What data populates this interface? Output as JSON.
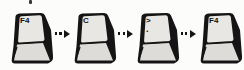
{
  "diagram": {
    "keys": [
      {
        "label": "F4"
      },
      {
        "label": "C"
      },
      {
        "label": ">",
        "sublabel": "."
      },
      {
        "label": "F4"
      }
    ],
    "arrow": {
      "style": "dotted",
      "direction": "right",
      "count": 3
    },
    "colors": {
      "key_top": "#e8e7e3",
      "key_front": "#dddcd8",
      "outline": "#151515",
      "background": "#fcfcfa"
    }
  }
}
